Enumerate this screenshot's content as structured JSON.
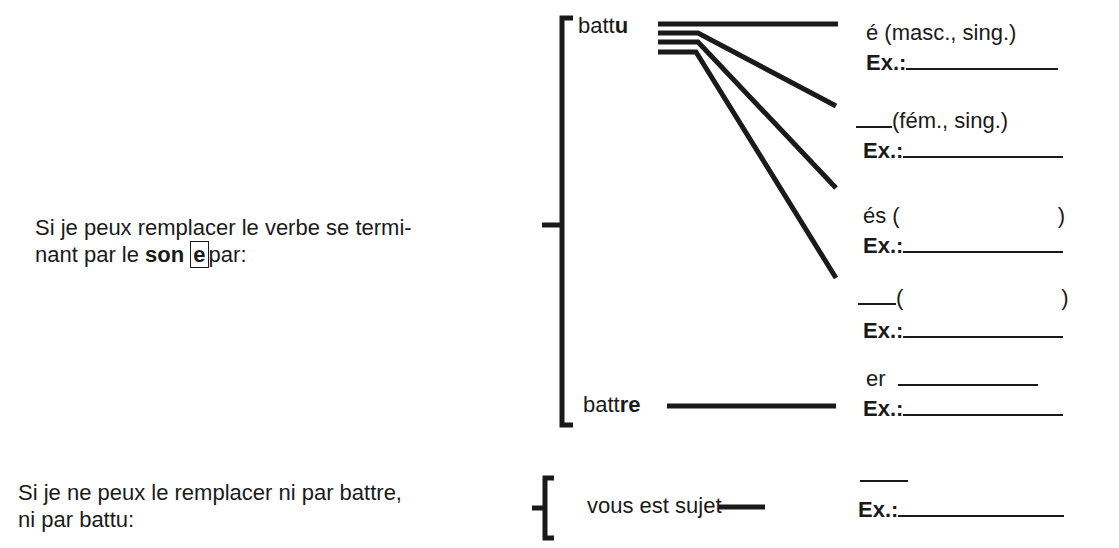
{
  "left": {
    "main_line1": "Si je peux remplacer le verbe se termi-",
    "main_line2_pre": "nant par le ",
    "main_line2_bold": "son",
    "main_line2_boxed": "e",
    "main_line2_post": "par:",
    "second_line1": "Si je ne peux le remplacer ni par battre,",
    "second_line2": "ni par battu:"
  },
  "middle": {
    "battu_stem": "batt",
    "battu_ending": "u",
    "battre_stem": "batt",
    "battre_ending": "re",
    "vous_label": "vous est sujet"
  },
  "right": {
    "r1": "é (masc., sing.)",
    "r2": "(fém., sing.)",
    "r3_pre": "és (",
    "r3_post": ")",
    "r4_pre": "(",
    "r4_post": ")",
    "r5": "er",
    "ex_label": "Ex.:"
  }
}
